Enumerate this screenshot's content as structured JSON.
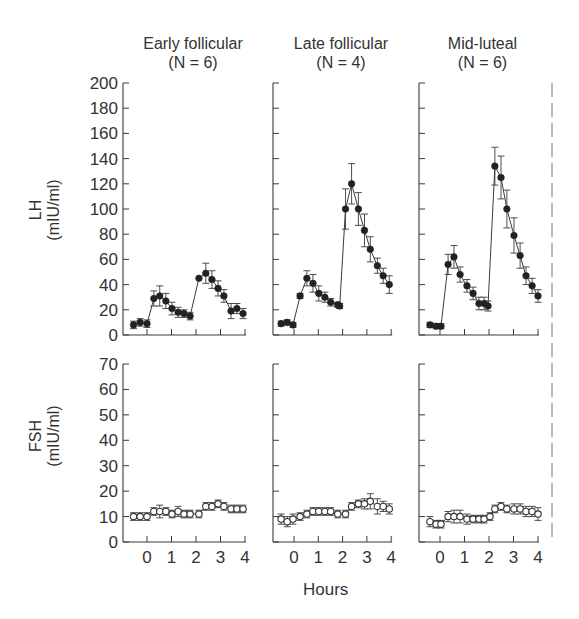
{
  "chart_data": {
    "type": "line",
    "layout": "2 rows x 3 columns of panels sharing axes",
    "xlabel": "Hours",
    "x_ticks": [
      0,
      1,
      2,
      3,
      4
    ],
    "xlim": [
      -1,
      4.1
    ],
    "legend": "none",
    "grid": false,
    "columns": [
      {
        "title": "Early follicular",
        "n_label": "(N = 6)"
      },
      {
        "title": "Late follicular",
        "n_label": "(N = 4)"
      },
      {
        "title": "Mid-luteal",
        "n_label": "(N = 6)"
      }
    ],
    "rows": [
      {
        "hormone": "LH",
        "ylabel_line1": "LH",
        "ylabel_line2": "(mIU/ml)",
        "ylim": [
          0,
          200
        ],
        "y_ticks": [
          0,
          20,
          40,
          60,
          80,
          100,
          120,
          140,
          160,
          180,
          200
        ],
        "marker": "filled circle",
        "series": [
          {
            "panel": "Early follicular",
            "x": [
              -0.55,
              -0.28,
              0,
              0.28,
              0.52,
              0.77,
              1.02,
              1.27,
              1.51,
              1.76,
              2.12,
              2.4,
              2.65,
              2.9,
              3.14,
              3.43,
              3.67,
              3.92
            ],
            "y": [
              8,
              10,
              9,
              29,
              31,
              27,
              21,
              18,
              17,
              15,
              45,
              49,
              44,
              37,
              31,
              19,
              21,
              17
            ],
            "err": [
              3,
              3,
              3,
              6,
              8,
              6,
              5,
              4,
              3,
              3,
              0,
              8,
              7,
              6,
              5,
              6,
              4,
              4
            ],
            "break_after_index": [
              2,
              9
            ]
          },
          {
            "panel": "Late follicular",
            "x": [
              -0.53,
              -0.28,
              -0.04,
              0.25,
              0.53,
              0.78,
              1.02,
              1.27,
              1.51,
              1.8,
              1.88,
              2.12,
              2.37,
              2.65,
              2.9,
              3.14,
              3.43,
              3.67,
              3.92
            ],
            "y": [
              9,
              10,
              8,
              31,
              45,
              41,
              33,
              30,
              26,
              24,
              23,
              100,
              120,
              100,
              83,
              68,
              55,
              47,
              40
            ],
            "err": [
              2,
              2,
              2,
              2,
              6,
              7,
              6,
              4,
              3,
              2,
              2,
              16,
              16,
              13,
              13,
              10,
              6,
              6,
              7
            ],
            "break_after_index": [
              2,
              10
            ]
          },
          {
            "panel": "Mid-luteal",
            "x": [
              -0.41,
              -0.16,
              0.04,
              0.33,
              0.57,
              0.82,
              1.1,
              1.35,
              1.59,
              1.8,
              1.96,
              2.24,
              2.49,
              2.73,
              3.02,
              3.27,
              3.51,
              3.76,
              4.0
            ],
            "y": [
              8,
              7,
              7,
              56,
              62,
              48,
              39,
              33,
              25,
              25,
              23,
              134,
              125,
              100,
              79,
              63,
              47,
              39,
              31
            ],
            "err": [
              2,
              2,
              2,
              8,
              9,
              6,
              5,
              5,
              5,
              5,
              4,
              15,
              17,
              15,
              14,
              10,
              7,
              6,
              5
            ],
            "break_after_index": [
              2,
              10
            ]
          }
        ]
      },
      {
        "hormone": "FSH",
        "ylabel_line1": "FSH",
        "ylabel_line2": "(mIU/ml)",
        "ylim": [
          0,
          70
        ],
        "y_ticks": [
          0,
          10,
          20,
          30,
          40,
          50,
          60,
          70
        ],
        "marker": "open circle",
        "series": [
          {
            "panel": "Early follicular",
            "x": [
              -0.55,
              -0.28,
              0,
              0.28,
              0.52,
              0.77,
              1.02,
              1.27,
              1.51,
              1.76,
              2.12,
              2.4,
              2.65,
              2.9,
              3.14,
              3.43,
              3.67,
              3.92
            ],
            "y": [
              10,
              10,
              10,
              12,
              12,
              12,
              11,
              12,
              11,
              11,
              11,
              14,
              14,
              15,
              14,
              13,
              13,
              13
            ],
            "err": [
              1.5,
              1.5,
              1.5,
              1.5,
              2.5,
              1.5,
              1.5,
              2,
              1.5,
              1.5,
              1.5,
              1.5,
              1.5,
              1.5,
              1.5,
              1.5,
              1.5,
              1.5
            ]
          },
          {
            "panel": "Late follicular",
            "x": [
              -0.53,
              -0.28,
              -0.04,
              0.25,
              0.53,
              0.78,
              1.02,
              1.27,
              1.51,
              1.8,
              2.12,
              2.37,
              2.65,
              2.9,
              3.14,
              3.43,
              3.67,
              3.92
            ],
            "y": [
              9,
              8,
              9,
              10,
              11,
              12,
              12,
              12,
              12,
              11,
              11,
              14,
              15,
              15,
              16,
              14,
              14,
              13
            ],
            "err": [
              2,
              2,
              2,
              1.5,
              1.5,
              1.5,
              1.5,
              1.5,
              1.5,
              1.5,
              1.5,
              1.5,
              1.5,
              2,
              3,
              3,
              2,
              2
            ]
          },
          {
            "panel": "Mid-luteal",
            "x": [
              -0.41,
              -0.16,
              0.04,
              0.33,
              0.57,
              0.82,
              1.1,
              1.35,
              1.59,
              1.8,
              2.04,
              2.24,
              2.49,
              2.73,
              3.02,
              3.27,
              3.51,
              3.76,
              4.0
            ],
            "y": [
              8,
              7,
              7,
              10,
              10,
              10,
              9,
              9,
              9,
              9,
              10,
              13,
              14,
              13,
              13,
              13,
              12,
              12,
              11
            ],
            "err": [
              2,
              1.5,
              1.5,
              2,
              2.5,
              2.5,
              2,
              1.5,
              1.5,
              1.5,
              1.5,
              1.5,
              1.5,
              1.5,
              2,
              2,
              2,
              2,
              2.5
            ]
          }
        ]
      }
    ]
  },
  "labels": {
    "col1_title": "Early follicular",
    "col1_n": "(N = 6)",
    "col2_title": "Late follicular",
    "col2_n": "(N = 4)",
    "col3_title": "Mid-luteal",
    "col3_n": "(N = 6)",
    "lh_label": "LH",
    "lh_unit": "(mIU/ml)",
    "fsh_label": "FSH",
    "fsh_unit": "(mIU/ml)",
    "x_axis_label": "Hours"
  }
}
